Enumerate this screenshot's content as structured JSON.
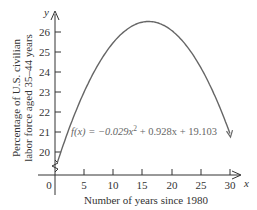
{
  "chart_data": {
    "type": "line",
    "title": "",
    "xlabel": "Number of years since 1980",
    "ylabel_line1": "Percentage of U.S. civilian",
    "ylabel_line2": "labor force aged 35–44 years",
    "x_axis_symbol": "x",
    "y_axis_symbol": "y",
    "x_ticks": [
      "0",
      "5",
      "10",
      "15",
      "20",
      "25",
      "30"
    ],
    "y_ticks": [
      "20",
      "21",
      "22",
      "23",
      "24",
      "25",
      "26"
    ],
    "xlim": [
      0,
      31
    ],
    "ylim": [
      19,
      27
    ],
    "y_axis_break": true,
    "grid": false,
    "function_label": "f(x) = −0.029x² + 0.928x + 19.103",
    "function_label_parts": {
      "lhs": "f(x) = −0.029x",
      "exp": "2",
      "rhs": " + 0.928x + 19.103"
    },
    "series": [
      {
        "name": "f(x) = -0.029x^2 + 0.928x + 19.103",
        "coefficients": {
          "a": -0.029,
          "b": 0.928,
          "c": 19.103
        },
        "x": [
          0,
          2,
          4,
          6,
          8,
          10,
          12,
          14,
          16,
          18,
          20,
          22,
          24,
          26,
          28,
          30
        ],
        "values": [
          19.103,
          20.843,
          22.351,
          23.627,
          24.671,
          25.483,
          26.063,
          26.411,
          26.527,
          26.411,
          26.063,
          25.483,
          24.671,
          23.627,
          22.351,
          20.843
        ]
      }
    ],
    "colors": {
      "curve": "#666666",
      "axes": "#333333",
      "text": "#333333"
    }
  }
}
